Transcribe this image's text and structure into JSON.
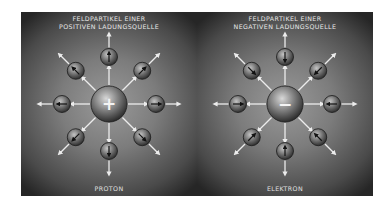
{
  "panels": [
    {
      "title_line1": "FELDPARTIKEL EINER",
      "title_line2": "POSITIVEN LADUNGSQUELLE",
      "caption": "PROTON",
      "center_symbol": "+",
      "charge": "positive",
      "particle_count": 8
    },
    {
      "title_line1": "FELDPARTIKEL EINER",
      "title_line2": "NEGATIVEN LADUNGSQUELLE",
      "caption": "ELEKTRON",
      "center_symbol": "−",
      "charge": "negative",
      "particle_count": 8
    }
  ],
  "colors": {
    "arrow": "#ececec",
    "text": "#e8e8e8",
    "sphere_dark": "#2a2a2a",
    "sphere_light": "#bdbdbd"
  }
}
